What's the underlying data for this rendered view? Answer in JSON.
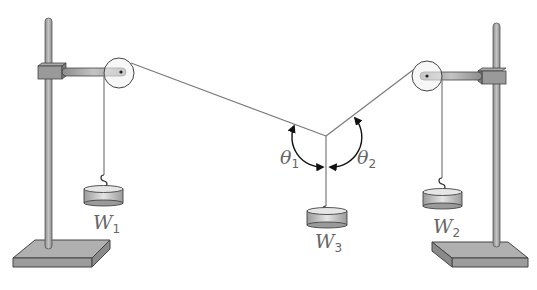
{
  "figure": {
    "type": "force-table-equilibrium-apparatus",
    "colors": {
      "stand": "#a9a9a9",
      "stand_dark": "#8a8a8a",
      "outline": "#4a4a4a",
      "string": "#7a7a7a",
      "weight": "#c8c8c8",
      "label": "#666666"
    }
  },
  "labels": {
    "w1": {
      "main": "W",
      "sub": "1"
    },
    "w2": {
      "main": "W",
      "sub": "2"
    },
    "w3": {
      "main": "W",
      "sub": "3"
    },
    "theta1": {
      "main": "θ",
      "sub": "1"
    },
    "theta2": {
      "main": "θ",
      "sub": "2"
    }
  }
}
